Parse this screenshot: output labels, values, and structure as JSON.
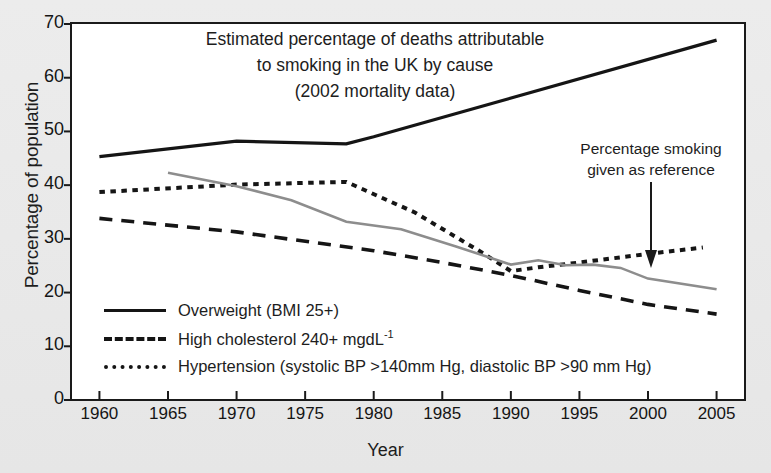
{
  "figure": {
    "title_lines": [
      "Estimated percentage of deaths attributable",
      "to smoking in the UK by cause",
      "(2002 mortality data)"
    ],
    "annotation_lines": [
      "Percentage smoking",
      "given as reference"
    ],
    "annotation_arrow": "down-arrow-icon",
    "background_color": "#e9e9e9",
    "plot_background_color": "#ffffff",
    "frame_color": "#1a1a1a"
  },
  "chart_data": {
    "type": "line",
    "title": "Estimated percentage of deaths attributable to smoking in the UK by cause (2002 mortality data)",
    "xlabel": "Year",
    "ylabel": "Percentage of population",
    "xlim": [
      1958,
      2007
    ],
    "ylim": [
      0,
      70
    ],
    "xticks": [
      1960,
      1965,
      1970,
      1975,
      1980,
      1985,
      1990,
      1995,
      2000,
      2005
    ],
    "yticks": [
      0,
      10,
      20,
      30,
      40,
      50,
      60,
      70
    ],
    "grid": false,
    "legend_position": "inside-lower-left",
    "series": [
      {
        "name": "Overweight (BMI 25+)",
        "style": "solid",
        "color": "#151515",
        "x": [
          1960,
          1970,
          1978,
          1980,
          2005
        ],
        "values": [
          45.3,
          48.2,
          47.7,
          49.0,
          67.0
        ]
      },
      {
        "name": "High cholesterol 240+ mgdL-1",
        "style": "dashed",
        "color": "#151515",
        "x": [
          1960,
          1970,
          1980,
          1985,
          1990,
          1995,
          2000,
          2005
        ],
        "values": [
          33.8,
          31.3,
          27.8,
          25.6,
          23.2,
          20.4,
          17.8,
          16.0
        ]
      },
      {
        "name": "Hypertension (systolic BP >140mm Hg, diastolic BP >90 mm Hg)",
        "style": "dotted",
        "color": "#151515",
        "x": [
          1960,
          1970,
          1978,
          1983,
          1988,
          1990,
          1992,
          1995,
          2000,
          2004
        ],
        "values": [
          38.7,
          40.1,
          40.6,
          34.9,
          27.3,
          24.0,
          24.7,
          25.6,
          27.2,
          28.4
        ]
      },
      {
        "name": "Percentage smoking",
        "style": "solid-gray",
        "color": "#8d8d8d",
        "x": [
          1965,
          1970,
          1974,
          1978,
          1982,
          1986,
          1990,
          1992,
          1994,
          1996,
          1998,
          2000,
          2005
        ],
        "values": [
          42.3,
          39.8,
          37.2,
          33.2,
          31.8,
          28.6,
          25.2,
          26.0,
          25.1,
          25.2,
          24.6,
          22.6,
          20.6
        ]
      }
    ]
  },
  "axes": {
    "ylabel": "Percentage of population",
    "xlabel": "Year",
    "yticks": [
      "0",
      "10",
      "20",
      "30",
      "40",
      "50",
      "60",
      "70"
    ],
    "xticks": [
      "1960",
      "1965",
      "1970",
      "1975",
      "1980",
      "1985",
      "1990",
      "1995",
      "2000",
      "2005"
    ]
  },
  "legend": {
    "items": [
      {
        "key": "solid-line-key",
        "label": "Overweight (BMI 25+)",
        "style": "solid"
      },
      {
        "key": "dashed-line-key",
        "label": "High cholesterol 240+ mgdL",
        "sup": "-1",
        "style": "dashed"
      },
      {
        "key": "dotted-line-key",
        "label": "Hypertension (systolic BP >140mm Hg, diastolic BP >90 mm Hg)",
        "style": "dotted"
      }
    ]
  }
}
